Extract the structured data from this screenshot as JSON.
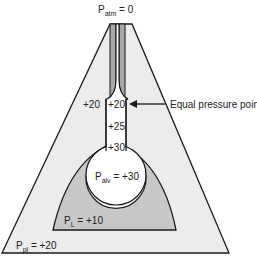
{
  "diagram": {
    "labels": {
      "p_atm": {
        "main": "P",
        "sub": "atm",
        "rest": " = 0"
      },
      "pleural_upper": "+20",
      "airway_epp": "+20",
      "airway_mid": "+25",
      "airway_low": "+30",
      "p_alv": {
        "main": "P",
        "sub": "alv",
        "rest": " = +30"
      },
      "p_l": {
        "main": "P",
        "sub": "L",
        "rest": " = +10"
      },
      "p_pl": {
        "main": "P",
        "sub": "pl",
        "rest": " = +20"
      },
      "annotation": "Equal pressure point"
    },
    "colors": {
      "pleural_space": "#ececec",
      "lung_tissue": "#c8c8c8",
      "airway_wall": "#a9a9a9",
      "airway_lumen": "#ffffff",
      "stroke": "#1a1a1a"
    }
  }
}
